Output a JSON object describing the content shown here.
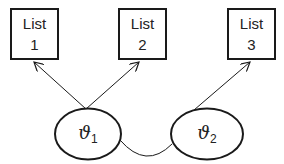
{
  "diagram": {
    "lists": [
      {
        "id": "list-1",
        "line1": "List",
        "line2": "1",
        "x": 10,
        "y": 8,
        "w": 49,
        "h": 52
      },
      {
        "id": "list-2",
        "line1": "List",
        "line2": "2",
        "x": 118,
        "y": 8,
        "w": 49,
        "h": 52
      },
      {
        "id": "list-3",
        "line1": "List",
        "line2": "3",
        "x": 227,
        "y": 8,
        "w": 49,
        "h": 52
      }
    ],
    "nodes": [
      {
        "id": "theta-1",
        "symbol": "ϑ",
        "subscript": "1",
        "cx": 88,
        "cy": 134,
        "rx": 33,
        "ry": 26
      },
      {
        "id": "theta-2",
        "symbol": "ϑ",
        "subscript": "2",
        "cx": 207,
        "cy": 134,
        "rx": 36,
        "ry": 26
      }
    ],
    "edges": [
      {
        "from": "theta-1",
        "to": "list-1",
        "directed": true
      },
      {
        "from": "theta-1",
        "to": "list-2",
        "directed": true
      },
      {
        "from": "theta-2",
        "to": "list-3",
        "directed": true
      },
      {
        "from": "theta-1",
        "to": "theta-2",
        "directed": false,
        "style": "curved"
      }
    ],
    "colors": {
      "stroke": "#1a1a1a",
      "background": "#ffffff"
    }
  }
}
